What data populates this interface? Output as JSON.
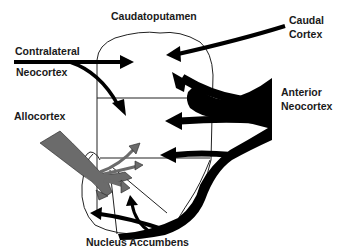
{
  "diagram": {
    "title_top": "Caudatoputamen",
    "labels": {
      "caudatoputamen": "Caudatoputamen",
      "caudal_cortex_line1": "Caudal",
      "caudal_cortex_line2": "Cortex",
      "contralateral_line1": "Contralateral",
      "contralateral_line2": "Neocortex",
      "allocortex": "Allocortex",
      "anterior_line1": "Anterior",
      "anterior_line2": "Neocortex",
      "nucleus_accumbens": "Nucleus  Accumbens"
    },
    "colors": {
      "neocortex_arrows": "#000000",
      "allocortex_arrows": "#6b6b6b",
      "outline": "#222222",
      "background": "#ffffff"
    },
    "regions": [
      "Caudatoputamen",
      "Nucleus Accumbens"
    ],
    "projections": [
      {
        "from": "Contralateral Neocortex",
        "to": "Caudatoputamen",
        "style": "black-thin"
      },
      {
        "from": "Caudal Cortex",
        "to": "Caudatoputamen",
        "style": "black-thin"
      },
      {
        "from": "Anterior Neocortex",
        "to": "Caudatoputamen and Nucleus Accumbens",
        "style": "black-thick"
      },
      {
        "from": "Allocortex",
        "to": "Nucleus Accumbens and ventral Caudatoputamen",
        "style": "gray-thick"
      }
    ]
  }
}
